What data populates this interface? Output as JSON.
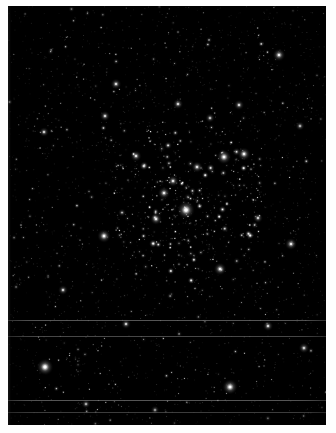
{
  "image": {
    "kind": "astronomical-star-field",
    "title": "Open star cluster field",
    "width": 336,
    "height": 433,
    "background_color": "#ffffff",
    "plate_color": "#000000",
    "star_color": "#ffffff",
    "frame": {
      "x": 8,
      "y": 6,
      "width": 318,
      "height": 419
    }
  },
  "chart_data": {
    "type": "scatter",
    "xlabel": "",
    "ylabel": "",
    "xlim": [
      0,
      318
    ],
    "ylim": [
      0,
      419
    ],
    "grid": false,
    "legend": null,
    "field": {
      "seed": 20377,
      "background_star_count": 760,
      "cluster_star_count": 240,
      "cluster_center": [
        178,
        196
      ],
      "cluster_radius": 78,
      "background_radius_range": [
        0.45,
        1.5
      ],
      "cluster_radius_range": [
        0.5,
        1.9
      ],
      "background_brightness_range": [
        0.16,
        0.8
      ],
      "cluster_brightness_range": [
        0.26,
        1.0
      ]
    },
    "bright_stars": [
      {
        "x": 178,
        "y": 204,
        "r": 3.9,
        "b": 1.0
      },
      {
        "x": 37,
        "y": 361,
        "r": 3.7,
        "b": 0.98
      },
      {
        "x": 222,
        "y": 381,
        "r": 3.4,
        "b": 0.95
      },
      {
        "x": 216,
        "y": 151,
        "r": 3.2,
        "b": 0.93
      },
      {
        "x": 236,
        "y": 148,
        "r": 2.9,
        "b": 0.9
      },
      {
        "x": 96,
        "y": 230,
        "r": 3.0,
        "b": 0.92
      },
      {
        "x": 212,
        "y": 263,
        "r": 2.8,
        "b": 0.88
      },
      {
        "x": 271,
        "y": 49,
        "r": 2.8,
        "b": 0.88
      },
      {
        "x": 283,
        "y": 238,
        "r": 2.7,
        "b": 0.86
      },
      {
        "x": 156,
        "y": 187,
        "r": 2.7,
        "b": 0.87
      },
      {
        "x": 165,
        "y": 175,
        "r": 2.5,
        "b": 0.84
      },
      {
        "x": 189,
        "y": 161,
        "r": 2.5,
        "b": 0.84
      },
      {
        "x": 148,
        "y": 213,
        "r": 2.6,
        "b": 0.85
      },
      {
        "x": 128,
        "y": 150,
        "r": 2.5,
        "b": 0.83
      },
      {
        "x": 108,
        "y": 78,
        "r": 2.4,
        "b": 0.82
      },
      {
        "x": 97,
        "y": 110,
        "r": 2.3,
        "b": 0.8
      },
      {
        "x": 260,
        "y": 320,
        "r": 2.3,
        "b": 0.8
      },
      {
        "x": 296,
        "y": 342,
        "r": 2.4,
        "b": 0.81
      },
      {
        "x": 55,
        "y": 284,
        "r": 2.2,
        "b": 0.78
      },
      {
        "x": 231,
        "y": 99,
        "r": 2.3,
        "b": 0.79
      },
      {
        "x": 36,
        "y": 126,
        "r": 2.2,
        "b": 0.78
      },
      {
        "x": 170,
        "y": 98,
        "r": 2.3,
        "b": 0.8
      },
      {
        "x": 250,
        "y": 212,
        "r": 2.2,
        "b": 0.77
      },
      {
        "x": 118,
        "y": 318,
        "r": 2.2,
        "b": 0.77
      },
      {
        "x": 202,
        "y": 112,
        "r": 2.1,
        "b": 0.76
      },
      {
        "x": 292,
        "y": 120,
        "r": 2.1,
        "b": 0.75
      },
      {
        "x": 78,
        "y": 398,
        "r": 2.1,
        "b": 0.75
      },
      {
        "x": 147,
        "y": 404,
        "r": 2.0,
        "b": 0.74
      }
    ],
    "scanlines": [
      {
        "y": 314,
        "opacity": 0.5
      },
      {
        "y": 330,
        "opacity": 0.42
      },
      {
        "y": 394,
        "opacity": 0.52
      },
      {
        "y": 406,
        "opacity": 0.44
      }
    ]
  }
}
